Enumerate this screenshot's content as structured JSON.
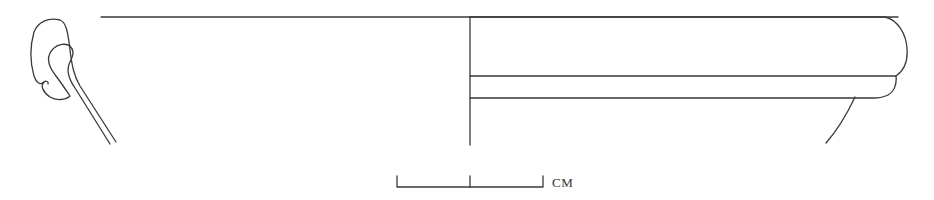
{
  "figure": {
    "type": "pottery-profile-drawing",
    "stroke_color": "#3a3a3a"
  },
  "scale_bar": {
    "unit_label": "CM",
    "segments": 2
  }
}
